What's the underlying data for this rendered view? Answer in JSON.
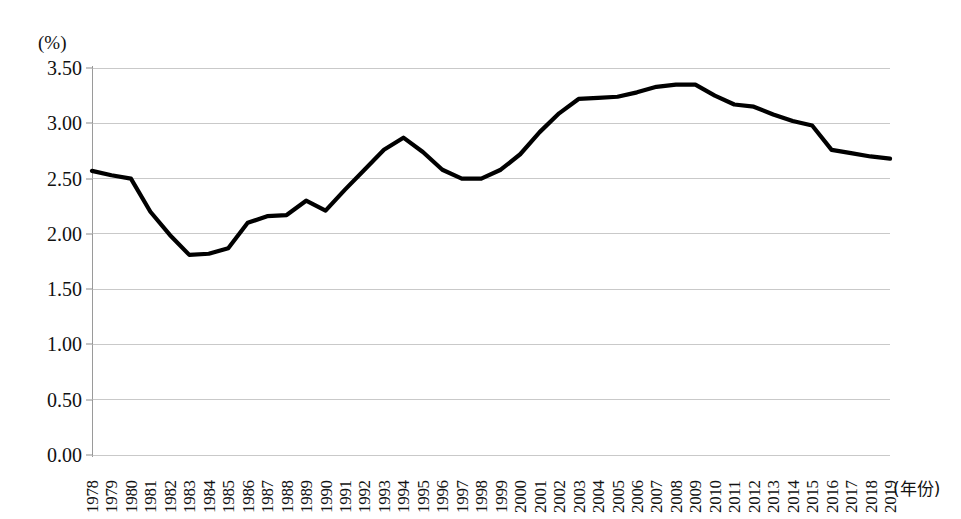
{
  "chart_data": {
    "type": "line",
    "title": "",
    "subtitle": "",
    "xlabel": "(年份)",
    "ylabel": "(%)",
    "unit_label": "(%)",
    "grid": true,
    "legend": false,
    "legend_position": "none",
    "line_color": "#000000",
    "grid_color": "#c9c9c9",
    "axis_color": "#8c8c8c",
    "ylim": [
      0.0,
      3.5
    ],
    "ytick_labels": [
      "3.50",
      "3.00",
      "2.50",
      "2.00",
      "1.50",
      "1.00",
      "0.50",
      "0.00"
    ],
    "ytick_values": [
      3.5,
      3.0,
      2.5,
      2.0,
      1.5,
      1.0,
      0.5,
      0.0
    ],
    "categories": [
      "1978",
      "1979",
      "1980",
      "1981",
      "1982",
      "1983",
      "1984",
      "1985",
      "1986",
      "1987",
      "1988",
      "1989",
      "1990",
      "1991",
      "1992",
      "1993",
      "1994",
      "1995",
      "1996",
      "1997",
      "1998",
      "1999",
      "2000",
      "2001",
      "2002",
      "2003",
      "2004",
      "2005",
      "2006",
      "2007",
      "2008",
      "2009",
      "2010",
      "2011",
      "2012",
      "2013",
      "2014",
      "2015",
      "2016",
      "2017",
      "2018",
      "2019"
    ],
    "values": [
      2.57,
      2.53,
      2.5,
      2.2,
      1.99,
      1.81,
      1.82,
      1.87,
      2.1,
      2.16,
      2.17,
      2.3,
      2.21,
      2.4,
      2.58,
      2.76,
      2.87,
      2.74,
      2.58,
      2.5,
      2.5,
      2.58,
      2.72,
      2.92,
      3.09,
      3.22,
      3.23,
      3.24,
      3.28,
      3.33,
      3.35,
      3.35,
      3.25,
      3.17,
      3.15,
      3.08,
      3.02,
      2.98,
      2.76,
      2.73,
      2.7,
      2.68
    ]
  }
}
